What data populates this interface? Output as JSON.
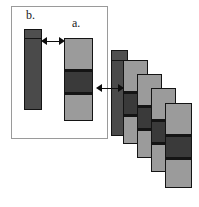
{
  "figure": {
    "width": 199,
    "height": 207,
    "background": "#ffffff"
  },
  "colors": {
    "panel_border": "#9a9a9a",
    "bar_outline": "#141414",
    "dark_bar": "#4a4a4a",
    "dark_band": "#3a3a3a",
    "light_segment": "#9b9b9b",
    "mid_segment": "#8e8e8e",
    "arrow": "#0d0d0d",
    "label_text": "#1a1a1a"
  },
  "panel": {
    "name": "inset-panel",
    "x": 11,
    "y": 6,
    "width": 97,
    "height": 133
  },
  "labels": [
    {
      "id": "label-b",
      "text": "b.",
      "x": 26,
      "y": 9
    },
    {
      "id": "label-a",
      "text": "a.",
      "x": 72,
      "y": 17
    }
  ],
  "bars": [
    {
      "id": "bar-b",
      "label": "b.",
      "x": 24,
      "y": 29,
      "width": 18,
      "height": 81,
      "fill": "#4a4a4a",
      "segments": [
        {
          "name": "cap",
          "top": 0,
          "height": 8,
          "fill": "#4f4f4f"
        },
        {
          "name": "body",
          "top": 9,
          "height": 70,
          "fill": "#4a4a4a"
        }
      ],
      "rules": [
        {
          "top": 8,
          "height": 1
        }
      ]
    },
    {
      "id": "bar-a",
      "label": "a.",
      "x": 64,
      "y": 38,
      "width": 29,
      "height": 83,
      "fill": "#9b9b9b",
      "segments": [
        {
          "name": "top-light",
          "top": 0,
          "height": 30,
          "fill": "#9b9b9b"
        },
        {
          "name": "dark-band",
          "top": 33,
          "height": 20,
          "fill": "#3a3a3a"
        },
        {
          "name": "bottom-light",
          "top": 56,
          "height": 25,
          "fill": "#9b9b9b"
        }
      ],
      "rules": [
        {
          "top": 30,
          "height": 3
        },
        {
          "top": 53,
          "height": 3
        }
      ]
    },
    {
      "id": "cascade-bar-0",
      "label": "cascade back dark",
      "x": 111,
      "y": 50,
      "width": 17,
      "height": 86,
      "fill": "#4a4a4a",
      "segments": [
        {
          "name": "cap",
          "top": 0,
          "height": 9,
          "fill": "#4f4f4f"
        },
        {
          "name": "body",
          "top": 10,
          "height": 74,
          "fill": "#4a4a4a"
        }
      ],
      "rules": [
        {
          "top": 9,
          "height": 1
        }
      ]
    },
    {
      "id": "cascade-bar-1",
      "label": "cascade 1",
      "x": 123,
      "y": 60,
      "width": 25,
      "height": 84,
      "fill": "#9b9b9b",
      "segments": [
        {
          "name": "top-light",
          "top": 0,
          "height": 30,
          "fill": "#9b9b9b"
        },
        {
          "name": "dark-band",
          "top": 33,
          "height": 20,
          "fill": "#3a3a3a"
        },
        {
          "name": "bottom-light",
          "top": 56,
          "height": 26,
          "fill": "#9b9b9b"
        }
      ],
      "rules": [
        {
          "top": 30,
          "height": 3
        },
        {
          "top": 53,
          "height": 3
        }
      ]
    },
    {
      "id": "cascade-bar-2",
      "label": "cascade 2",
      "x": 137,
      "y": 74,
      "width": 25,
      "height": 84,
      "fill": "#9b9b9b",
      "segments": [
        {
          "name": "top-light",
          "top": 0,
          "height": 30,
          "fill": "#9b9b9b"
        },
        {
          "name": "dark-band",
          "top": 33,
          "height": 20,
          "fill": "#3a3a3a"
        },
        {
          "name": "bottom-light",
          "top": 56,
          "height": 26,
          "fill": "#9b9b9b"
        }
      ],
      "rules": [
        {
          "top": 30,
          "height": 3
        },
        {
          "top": 53,
          "height": 3
        }
      ]
    },
    {
      "id": "cascade-bar-3",
      "label": "cascade 3",
      "x": 151,
      "y": 88,
      "width": 25,
      "height": 84,
      "fill": "#9b9b9b",
      "segments": [
        {
          "name": "top-light",
          "top": 0,
          "height": 30,
          "fill": "#9b9b9b"
        },
        {
          "name": "dark-band",
          "top": 33,
          "height": 20,
          "fill": "#3a3a3a"
        },
        {
          "name": "bottom-light",
          "top": 56,
          "height": 26,
          "fill": "#9b9b9b"
        }
      ],
      "rules": [
        {
          "top": 30,
          "height": 3
        },
        {
          "top": 53,
          "height": 3
        }
      ]
    },
    {
      "id": "cascade-bar-4",
      "label": "cascade 4",
      "x": 165,
      "y": 103,
      "width": 27,
      "height": 85,
      "fill": "#9b9b9b",
      "segments": [
        {
          "name": "top-light",
          "top": 0,
          "height": 30,
          "fill": "#9b9b9b"
        },
        {
          "name": "dark-band",
          "top": 33,
          "height": 20,
          "fill": "#3a3a3a"
        },
        {
          "name": "bottom-light",
          "top": 56,
          "height": 27,
          "fill": "#9b9b9b"
        }
      ],
      "rules": [
        {
          "top": 30,
          "height": 3
        },
        {
          "top": 53,
          "height": 3
        }
      ]
    }
  ],
  "arrows": [
    {
      "id": "arrow-b-to-a",
      "x": 41,
      "y": 37,
      "width": 24
    },
    {
      "id": "arrow-a-to-cascade",
      "x": 96,
      "y": 84,
      "width": 28
    }
  ]
}
